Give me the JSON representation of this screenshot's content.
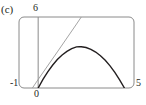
{
  "figure": {
    "panel_label": "(c)",
    "frame_color": "#8a8a8a",
    "curve_color": "#231f20",
    "line_color": "#9a9a9a",
    "axis_color": "#8a8a8a",
    "background": "#ffffff"
  },
  "labels": {
    "y_top": "6",
    "x_left": "-1",
    "x_zero": "0",
    "x_right": "5"
  },
  "chart_data": {
    "type": "line",
    "title": "(c)",
    "xlabel": "",
    "ylabel": "",
    "xlim": [
      -1,
      5
    ],
    "ylim": [
      0,
      6
    ],
    "grid": false,
    "legend": null,
    "axis_ticks": {
      "x": [
        "-1",
        "0",
        "5"
      ],
      "y": [
        "6"
      ]
    },
    "series": [
      {
        "name": "parabola",
        "type": "quadratic",
        "color": "#231f20",
        "width": 1.4,
        "equation": "y = -0.62 (x - 2.15)^2 + 2.9",
        "vertex": [
          2.15,
          2.9
        ],
        "roots": [
          0.0,
          4.3
        ],
        "points": [
          [
            0.0,
            0.0
          ],
          [
            0.25,
            0.72
          ],
          [
            0.5,
            1.36
          ],
          [
            0.75,
            1.92
          ],
          [
            1.0,
            2.4
          ],
          [
            1.25,
            2.79
          ],
          [
            1.5,
            3.1
          ],
          [
            1.75,
            3.33
          ],
          [
            2.0,
            3.48
          ],
          [
            2.15,
            3.5
          ],
          [
            2.25,
            3.49
          ],
          [
            2.5,
            3.42
          ],
          [
            2.75,
            3.27
          ],
          [
            3.0,
            3.04
          ],
          [
            3.25,
            2.73
          ],
          [
            3.5,
            2.34
          ],
          [
            3.75,
            1.87
          ],
          [
            4.0,
            1.32
          ],
          [
            4.25,
            0.69
          ],
          [
            4.5,
            0.0
          ]
        ]
      },
      {
        "name": "straight-line",
        "type": "linear",
        "color": "#9a9a9a",
        "width": 0.9,
        "equation": "y = 2.35 x + 0.72",
        "points": [
          [
            -0.3,
            0.0
          ],
          [
            0.0,
            0.72
          ],
          [
            1.0,
            3.05
          ],
          [
            2.0,
            5.4
          ],
          [
            2.25,
            6.0
          ]
        ]
      }
    ]
  }
}
